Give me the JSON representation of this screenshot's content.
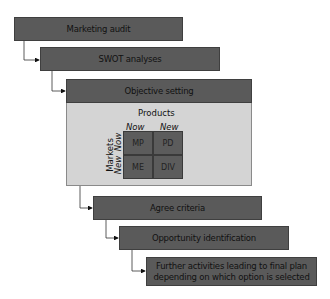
{
  "steps": [
    {
      "label": "Marketing audit"
    },
    {
      "label": "SWOT analyses"
    },
    {
      "label": "Objective setting"
    },
    {
      "label": "Agree criteria"
    },
    {
      "label": "Opportunity identification"
    },
    {
      "label": "Further activities leading to final plan depending on which option is selected"
    }
  ],
  "matrix": {
    "x_axis_title": "Products",
    "x_labels": [
      "Now",
      "New"
    ],
    "y_axis_title": "Markets",
    "y_labels": [
      "Now",
      "New"
    ],
    "cells": [
      "MP",
      "PD",
      "ME",
      "DIV"
    ]
  },
  "colors": {
    "box": "#5a5a5a",
    "panel": "#d4d4d4"
  }
}
